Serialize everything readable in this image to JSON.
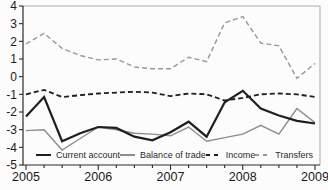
{
  "chart_data": {
    "type": "line",
    "title": "",
    "x": [
      2005,
      2005.25,
      2005.5,
      2005.75,
      2006,
      2006.25,
      2006.5,
      2006.75,
      2007,
      2007.25,
      2007.5,
      2007.75,
      2008,
      2008.25,
      2008.5,
      2008.75,
      2009
    ],
    "x_tick_labels": [
      "2005",
      "2006",
      "2007",
      "2008",
      "2009"
    ],
    "y_ticks": [
      4,
      3,
      2,
      1,
      0,
      -1,
      -2,
      -3,
      -4,
      -5
    ],
    "xlim": [
      2005,
      2009
    ],
    "ylim": [
      -5,
      4
    ],
    "grid": false,
    "legend_position": "bottom-inside",
    "series": [
      {
        "name": "Current account",
        "color": "#1f1f1f",
        "line_style": "solid",
        "line_width": 2.2,
        "values": [
          -2.25,
          -1.15,
          -3.65,
          -3.2,
          -2.85,
          -2.9,
          -3.4,
          -3.6,
          -3.15,
          -2.55,
          -3.4,
          -1.45,
          -0.8,
          -1.8,
          -2.2,
          -2.5,
          -2.65
        ]
      },
      {
        "name": "Balance of trade",
        "color": "#8d8d8d",
        "line_style": "solid",
        "line_width": 1.4,
        "values": [
          -3.05,
          -3.0,
          -4.15,
          -3.5,
          -2.85,
          -3.0,
          -3.2,
          -3.25,
          -3.35,
          -2.85,
          -3.65,
          -3.45,
          -3.25,
          -2.75,
          -3.25,
          -1.8,
          -2.6
        ]
      },
      {
        "name": "Income",
        "color": "#1f1f1f",
        "line_style": "dashed",
        "line_width": 1.8,
        "values": [
          -1.0,
          -0.75,
          -1.15,
          -1.05,
          -0.95,
          -0.9,
          -0.85,
          -0.9,
          -1.1,
          -0.95,
          -1.0,
          -1.35,
          -1.2,
          -1.0,
          -0.95,
          -1.0,
          -1.15
        ]
      },
      {
        "name": "Transfers",
        "color": "#989898",
        "line_style": "dashed",
        "line_width": 1.4,
        "values": [
          1.85,
          2.45,
          1.6,
          1.2,
          0.95,
          1.0,
          0.55,
          0.45,
          0.45,
          1.1,
          0.85,
          3.05,
          3.4,
          1.9,
          1.75,
          -0.1,
          0.75
        ]
      }
    ]
  },
  "colors": {
    "axis": "#2a2a2a",
    "box_border": "#a9a9a9",
    "tick_label": "#1a1a1a",
    "background": "#fcfcfc"
  }
}
